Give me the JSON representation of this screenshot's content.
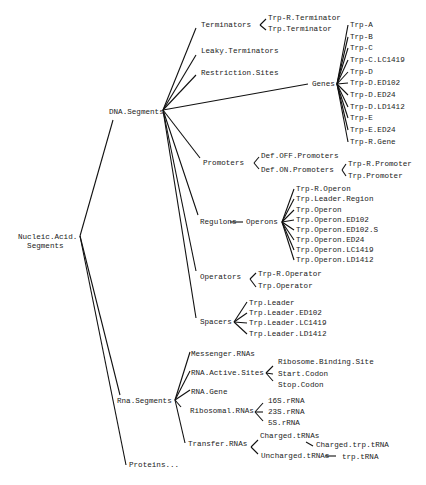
{
  "diagram": {
    "type": "tree",
    "root": "Nucleic.Acid.Segments",
    "nodes": [
      {
        "id": "root",
        "label": "Nucleic.Acid.\n  Segments",
        "x": 18,
        "y": 242
      },
      {
        "id": "dna",
        "label": "DNA.Segments",
        "x": 109,
        "y": 112
      },
      {
        "id": "rna",
        "label": "Rna.Segments",
        "x": 117,
        "y": 401
      },
      {
        "id": "proteins",
        "label": "Proteins...",
        "x": 129,
        "y": 465
      },
      {
        "id": "term",
        "label": "Terminators",
        "x": 201,
        "y": 25
      },
      {
        "id": "trpr_term",
        "label": "Trp-R.Terminator",
        "x": 268,
        "y": 18
      },
      {
        "id": "trp_term",
        "label": "Trp.Terminator",
        "x": 268,
        "y": 29
      },
      {
        "id": "leaky",
        "label": "Leaky.Terminators",
        "x": 201,
        "y": 51
      },
      {
        "id": "restr",
        "label": "Restriction.Sites",
        "x": 201,
        "y": 73
      },
      {
        "id": "genes",
        "label": "Genes",
        "x": 312,
        "y": 84
      },
      {
        "id": "g1",
        "label": "Trp-A",
        "x": 350,
        "y": 25
      },
      {
        "id": "g2",
        "label": "Trp-B",
        "x": 350,
        "y": 37
      },
      {
        "id": "g3",
        "label": "Trp-C",
        "x": 350,
        "y": 48
      },
      {
        "id": "g4",
        "label": "Trp-C.LC1419",
        "x": 350,
        "y": 60
      },
      {
        "id": "g5",
        "label": "Trp-D",
        "x": 350,
        "y": 72
      },
      {
        "id": "g6",
        "label": "Trp-D.ED102",
        "x": 350,
        "y": 83
      },
      {
        "id": "g7",
        "label": "Trp-D.ED24",
        "x": 350,
        "y": 95
      },
      {
        "id": "g8",
        "label": "Trp-D.LD1412",
        "x": 350,
        "y": 107
      },
      {
        "id": "g9",
        "label": "Trp-E",
        "x": 350,
        "y": 118
      },
      {
        "id": "g10",
        "label": "Trp-E.ED24",
        "x": 350,
        "y": 130
      },
      {
        "id": "g11",
        "label": "Trp-R.Gene",
        "x": 350,
        "y": 142
      },
      {
        "id": "prom",
        "label": "Promoters",
        "x": 203,
        "y": 163
      },
      {
        "id": "defoff",
        "label": "Def.OFF.Promoters",
        "x": 261,
        "y": 156
      },
      {
        "id": "defon",
        "label": "Def.ON.Promoters",
        "x": 261,
        "y": 170
      },
      {
        "id": "trpr_prom",
        "label": "Trp-R.Promoter",
        "x": 348,
        "y": 164
      },
      {
        "id": "trp_prom",
        "label": "Trp.Promoter",
        "x": 348,
        "y": 176
      },
      {
        "id": "regulons",
        "label": "Regulons",
        "x": 200,
        "y": 222
      },
      {
        "id": "operons",
        "label": "Operons",
        "x": 246,
        "y": 222
      },
      {
        "id": "o1",
        "label": "Trp-R.Operon",
        "x": 296,
        "y": 189
      },
      {
        "id": "o2",
        "label": "Trp.Leader.Region",
        "x": 296,
        "y": 199
      },
      {
        "id": "o3",
        "label": "Trp.Operon",
        "x": 296,
        "y": 210
      },
      {
        "id": "o4",
        "label": "Trp.Operon.ED102",
        "x": 296,
        "y": 220
      },
      {
        "id": "o5",
        "label": "Trp.Operon.ED102.S",
        "x": 296,
        "y": 230
      },
      {
        "id": "o6",
        "label": "Trp.Operon.ED24",
        "x": 296,
        "y": 240
      },
      {
        "id": "o7",
        "label": "Trp.Operon.LC1419",
        "x": 296,
        "y": 250
      },
      {
        "id": "o8",
        "label": "Trp.Operon.LD1412",
        "x": 296,
        "y": 260
      },
      {
        "id": "oper",
        "label": "Operators",
        "x": 200,
        "y": 277
      },
      {
        "id": "trpr_oper",
        "label": "Trp-R.Operator",
        "x": 258,
        "y": 274
      },
      {
        "id": "trp_oper",
        "label": "Trp.Operator",
        "x": 258,
        "y": 286
      },
      {
        "id": "spacers",
        "label": "Spacers",
        "x": 200,
        "y": 322
      },
      {
        "id": "s1",
        "label": "Trp.Leader",
        "x": 249,
        "y": 303
      },
      {
        "id": "s2",
        "label": "Trp.Leader.ED102",
        "x": 249,
        "y": 313
      },
      {
        "id": "s3",
        "label": "Trp.Leader.LC1419",
        "x": 249,
        "y": 323
      },
      {
        "id": "s4",
        "label": "Trp.Leader.LD1412",
        "x": 249,
        "y": 334
      },
      {
        "id": "mrna",
        "label": "Messenger.RNAs",
        "x": 191,
        "y": 354
      },
      {
        "id": "ras",
        "label": "RNA.Active.Sites",
        "x": 191,
        "y": 373
      },
      {
        "id": "rbs",
        "label": "Ribosome.Binding.Site",
        "x": 278,
        "y": 362
      },
      {
        "id": "start",
        "label": "Start.Codon",
        "x": 278,
        "y": 374
      },
      {
        "id": "stop",
        "label": "Stop.Codon",
        "x": 278,
        "y": 385
      },
      {
        "id": "rgene",
        "label": "RNA.Gene",
        "x": 191,
        "y": 392
      },
      {
        "id": "rrna",
        "label": "Ribosomal.RNAs",
        "x": 190,
        "y": 411
      },
      {
        "id": "r16",
        "label": "16S.rRNA",
        "x": 268,
        "y": 401
      },
      {
        "id": "r23",
        "label": "23S.rRNA",
        "x": 268,
        "y": 412
      },
      {
        "id": "r5",
        "label": "5S.rRNA",
        "x": 268,
        "y": 423
      },
      {
        "id": "trna",
        "label": "Transfer.RNAs",
        "x": 188,
        "y": 444
      },
      {
        "id": "ctrna",
        "label": "Charged.tRNAs",
        "x": 260,
        "y": 436
      },
      {
        "id": "ctrp",
        "label": "Charged.trp.tRNA",
        "x": 316,
        "y": 445
      },
      {
        "id": "utrna",
        "label": "Uncharged.tRNAs",
        "x": 261,
        "y": 456
      },
      {
        "id": "trptrna",
        "label": "trp.tRNA",
        "x": 342,
        "y": 457
      }
    ],
    "edges": [
      [
        80,
        236,
        113,
        120
      ],
      [
        80,
        236,
        120,
        395
      ],
      [
        80,
        236,
        126,
        465
      ],
      [
        163,
        110,
        196,
        28
      ],
      [
        163,
        110,
        196,
        55
      ],
      [
        163,
        110,
        196,
        75
      ],
      [
        163,
        110,
        308,
        84
      ],
      [
        163,
        110,
        200,
        158
      ],
      [
        163,
        110,
        198,
        215
      ],
      [
        163,
        110,
        196,
        271
      ],
      [
        163,
        110,
        196,
        318
      ],
      [
        260,
        25,
        266,
        19
      ],
      [
        260,
        25,
        266,
        30
      ],
      [
        337,
        84,
        348,
        25
      ],
      [
        337,
        84,
        348,
        37
      ],
      [
        337,
        84,
        348,
        48
      ],
      [
        337,
        84,
        348,
        60
      ],
      [
        337,
        84,
        348,
        72
      ],
      [
        337,
        84,
        348,
        83
      ],
      [
        337,
        84,
        348,
        95
      ],
      [
        337,
        84,
        348,
        107
      ],
      [
        337,
        84,
        348,
        118
      ],
      [
        337,
        84,
        348,
        130
      ],
      [
        337,
        84,
        348,
        142
      ],
      [
        254,
        163,
        259,
        157
      ],
      [
        254,
        163,
        259,
        169
      ],
      [
        342,
        170,
        346,
        164
      ],
      [
        342,
        170,
        346,
        176
      ],
      [
        230,
        222,
        243,
        222
      ],
      [
        282,
        222,
        294,
        189
      ],
      [
        282,
        222,
        294,
        199
      ],
      [
        282,
        222,
        294,
        210
      ],
      [
        282,
        222,
        294,
        220
      ],
      [
        282,
        222,
        294,
        230
      ],
      [
        282,
        222,
        294,
        240
      ],
      [
        282,
        222,
        294,
        250
      ],
      [
        282,
        222,
        294,
        260
      ],
      [
        250,
        279,
        256,
        273
      ],
      [
        250,
        279,
        256,
        287
      ],
      [
        234,
        322,
        247,
        302
      ],
      [
        234,
        322,
        247,
        313
      ],
      [
        234,
        322,
        247,
        323
      ],
      [
        234,
        322,
        247,
        334
      ],
      [
        175,
        400,
        190,
        352
      ],
      [
        175,
        400,
        190,
        371
      ],
      [
        175,
        400,
        190,
        390
      ],
      [
        175,
        400,
        181,
        407
      ],
      [
        175,
        400,
        185,
        443
      ],
      [
        266,
        373,
        273,
        366
      ],
      [
        266,
        373,
        273,
        374
      ],
      [
        266,
        373,
        273,
        381
      ],
      [
        255,
        412,
        263,
        403
      ],
      [
        255,
        412,
        263,
        412
      ],
      [
        255,
        412,
        263,
        421
      ],
      [
        251,
        447,
        258,
        440
      ],
      [
        251,
        447,
        258,
        454
      ],
      [
        306,
        442,
        313,
        446
      ],
      [
        325,
        456,
        336,
        456
      ]
    ]
  }
}
